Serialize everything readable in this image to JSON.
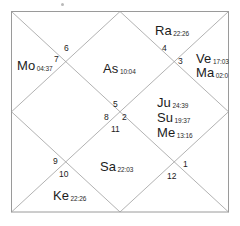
{
  "chart_meta": {
    "title": "North Indian Vedic Birth Chart (Kundali)",
    "style": "north-indian-diamond",
    "line_color": "#8c8c8c",
    "border_color": "#9a9a9a",
    "text_color": "#1c1c1c",
    "background": "#ffffff"
  },
  "chart_data": {
    "type": "diagram",
    "houses": [
      {
        "number": "1",
        "num_x": 183,
        "num_y": 160
      },
      {
        "number": "2",
        "num_x": 122,
        "num_y": 113
      },
      {
        "number": "3",
        "num_x": 178,
        "num_y": 57
      },
      {
        "number": "4",
        "num_x": 162,
        "num_y": 44
      },
      {
        "number": "5",
        "num_x": 113,
        "num_y": 100
      },
      {
        "number": "6",
        "num_x": 64,
        "num_y": 44
      },
      {
        "number": "7",
        "num_x": 54,
        "num_y": 55
      },
      {
        "number": "8",
        "num_x": 104,
        "num_y": 113
      },
      {
        "number": "9",
        "num_x": 53,
        "num_y": 157
      },
      {
        "number": "10",
        "num_x": 59,
        "num_y": 170
      },
      {
        "number": "11",
        "num_x": 111,
        "num_y": 125
      },
      {
        "number": "12",
        "num_x": 167,
        "num_y": 172
      }
    ],
    "planets": [
      {
        "abbr": "Ra",
        "degree": "22:26",
        "house": "4",
        "x": 155,
        "y": 22,
        "name": "rahu"
      },
      {
        "abbr": "Ve",
        "degree": "17:03",
        "house": "3",
        "x": 196,
        "y": 50,
        "name": "venus"
      },
      {
        "abbr": "Ma",
        "degree": "02:0",
        "house": "3",
        "x": 196,
        "y": 64,
        "name": "mars"
      },
      {
        "abbr": "Mo",
        "degree": "04:37",
        "house": "7",
        "x": 17,
        "y": 57,
        "name": "moon"
      },
      {
        "abbr": "As",
        "degree": "10:04",
        "house": "6",
        "x": 103,
        "y": 60,
        "name": "ascendant"
      },
      {
        "abbr": "Ju",
        "degree": "24:39",
        "house": "2",
        "x": 157,
        "y": 94,
        "name": "jupiter"
      },
      {
        "abbr": "Su",
        "degree": "19:37",
        "house": "2",
        "x": 157,
        "y": 109,
        "name": "sun"
      },
      {
        "abbr": "Me",
        "degree": "13:16",
        "house": "2",
        "x": 157,
        "y": 124,
        "name": "mercury"
      },
      {
        "abbr": "Sa",
        "degree": "22:03",
        "house": "11",
        "x": 100,
        "y": 158,
        "name": "saturn"
      },
      {
        "abbr": "Ke",
        "degree": "22:26",
        "house": "10",
        "x": 53,
        "y": 187,
        "name": "ketu"
      }
    ]
  }
}
